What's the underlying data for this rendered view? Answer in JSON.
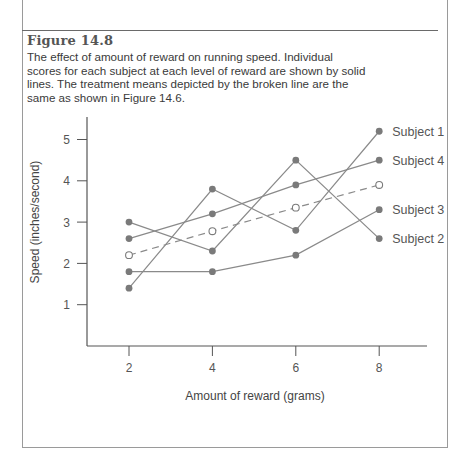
{
  "figure": {
    "label": "Figure 14.8",
    "caption": "The effect of amount of reward on running speed. Individual scores for each subject at each level of reward are shown by solid lines. The treatment means depicted by the broken line are the same as shown in Figure 14.6."
  },
  "chart_data": {
    "type": "line",
    "title": "Figure 14.8",
    "xlabel": "Amount of reward (grams)",
    "ylabel": "Speed (inches/second)",
    "x": [
      2,
      4,
      6,
      8
    ],
    "x_ticks": [
      "2",
      "4",
      "6",
      "8"
    ],
    "y_ticks": [
      "1",
      "2",
      "3",
      "4",
      "5"
    ],
    "ylim": [
      0,
      5.5
    ],
    "xlim": [
      1,
      10
    ],
    "grid": false,
    "legend_position": "right, inline labels at line ends",
    "series": [
      {
        "name": "Subject 1",
        "values": [
          1.4,
          3.8,
          2.8,
          5.2
        ],
        "style": "solid",
        "marker": "filled"
      },
      {
        "name": "Subject 2",
        "values": [
          3.0,
          2.3,
          4.5,
          2.6
        ],
        "style": "solid",
        "marker": "filled"
      },
      {
        "name": "Subject 3",
        "values": [
          1.8,
          1.8,
          2.2,
          3.3
        ],
        "style": "solid",
        "marker": "filled"
      },
      {
        "name": "Subject 4",
        "values": [
          2.6,
          3.2,
          3.9,
          4.5
        ],
        "style": "solid",
        "marker": "filled"
      },
      {
        "name": "Treatment means",
        "values": [
          2.2,
          2.78,
          3.35,
          3.9
        ],
        "style": "dashed",
        "marker": "open",
        "label_visible": false
      }
    ]
  },
  "colors": {
    "line": "#8a8a8a",
    "marker": "#7a7a7a",
    "axis": "#555555",
    "text": "#444444"
  }
}
